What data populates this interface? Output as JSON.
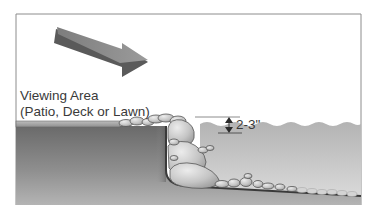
{
  "diagram": {
    "labels": {
      "viewing_area_line1": "Viewing Area",
      "viewing_area_line2": "(Patio, Deck or Lawn)",
      "depth_dimension": "2-3\""
    },
    "elements": {
      "flow_arrow": "arrow pointing down-right toward pond",
      "dimension_marker": "double-headed vertical arrow",
      "water_surface": "wavy water line",
      "rock_edge": "stacked boulders along pond edge",
      "pond_floor": "gravel-covered sloped bottom"
    },
    "colors": {
      "frame": "#8c8c8c",
      "ground_dark": "#5e5e5e",
      "ground_light": "#a8a8a8",
      "water_top": "#b8b8b8",
      "water_bottom": "#d8d8d8",
      "rock": "#c9c9c9",
      "liner": "#3a3a3a",
      "arrow_top": "#8a8a8a",
      "arrow_side": "#5a5a5a",
      "text": "#3a3a3a"
    }
  }
}
